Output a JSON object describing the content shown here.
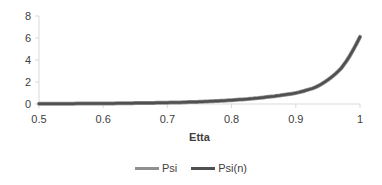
{
  "chart_data": {
    "type": "line",
    "title": "",
    "xlabel": "Etta",
    "ylabel": "",
    "xlim": [
      0.5,
      1
    ],
    "ylim": [
      0,
      8
    ],
    "x_ticks": [
      "0.5",
      "0.6",
      "0.7",
      "0.8",
      "0.9",
      "1"
    ],
    "y_ticks": [
      "0",
      "2",
      "4",
      "6",
      "8"
    ],
    "grid": false,
    "legend_position": "bottom",
    "x": [
      0.5,
      0.55,
      0.6,
      0.65,
      0.7,
      0.75,
      0.8,
      0.85,
      0.9,
      0.93,
      0.95,
      0.97,
      0.98,
      0.99,
      1.0
    ],
    "series": [
      {
        "name": "Psi",
        "color": "#909090",
        "values": [
          0.02,
          0.03,
          0.05,
          0.08,
          0.12,
          0.2,
          0.35,
          0.6,
          1.0,
          1.5,
          2.2,
          3.2,
          4.0,
          5.0,
          6.1
        ]
      },
      {
        "name": "Psi(n)",
        "color": "#505050",
        "values": [
          0.02,
          0.03,
          0.05,
          0.08,
          0.12,
          0.2,
          0.35,
          0.6,
          1.0,
          1.5,
          2.2,
          3.2,
          4.0,
          5.0,
          6.1
        ]
      }
    ]
  },
  "legend": [
    {
      "label": "Psi",
      "color": "#909090"
    },
    {
      "label": "Psi(n)",
      "color": "#505050"
    }
  ]
}
